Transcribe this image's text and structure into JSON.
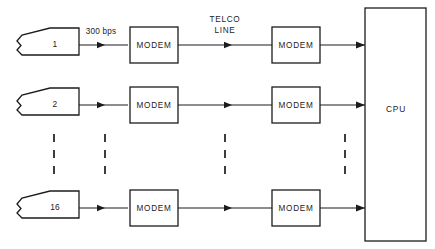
{
  "diagram": {
    "colors": {
      "line": "#1c1c1c",
      "background": "#ffffff",
      "dash": "#333333"
    },
    "rows": [
      {
        "terminal_label": "1",
        "rate_label": "300 bps",
        "link_label_line1": "TELCO",
        "link_label_line2": "LINE",
        "modem_near_label": "MODEM",
        "modem_far_label": "MODEM"
      },
      {
        "terminal_label": "2",
        "rate_label": "",
        "link_label_line1": "",
        "link_label_line2": "",
        "modem_near_label": "MODEM",
        "modem_far_label": "MODEM"
      },
      {
        "terminal_label": "16",
        "rate_label": "",
        "link_label_line1": "",
        "link_label_line2": "",
        "modem_near_label": "MODEM",
        "modem_far_label": "MODEM"
      }
    ],
    "cpu": {
      "label": "CPU"
    },
    "ellipsis": {
      "dot_count": 3,
      "column_count": 4
    }
  }
}
